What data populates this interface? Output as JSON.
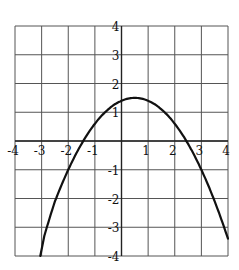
{
  "chart_data": {
    "type": "line",
    "title": "",
    "xlabel": "",
    "ylabel": "",
    "xlim": [
      -4,
      4
    ],
    "ylim": [
      -4,
      4
    ],
    "grid": true,
    "x_ticks": [
      -4,
      -3,
      -2,
      -1,
      1,
      2,
      3,
      4
    ],
    "y_ticks": [
      4,
      3,
      2,
      1,
      -1,
      -2,
      -3,
      -4
    ],
    "x_tick_labels": [
      "-4",
      "-3",
      "-2",
      "-1",
      "1",
      "2",
      "3",
      "4"
    ],
    "y_tick_labels": [
      "4",
      "3",
      "2",
      "1",
      "-1",
      "-2",
      "-3",
      "-4"
    ],
    "series": [
      {
        "name": "parabola",
        "description": "downward-opening parabola, vertex approx (0.5, 1.5), x-intercepts approx -1.44 and 2.44",
        "equation_estimate": "y = -0.4(x - 0.5)^2 + 1.5",
        "x": [
          -3.05,
          -3.0,
          -2.5,
          -2.0,
          -1.5,
          -1.0,
          -0.5,
          0.0,
          0.5,
          1.0,
          1.5,
          2.0,
          2.5,
          3.0,
          3.5,
          4.0
        ],
        "y": [
          -4.0,
          -3.4,
          -2.4,
          -1.0,
          -0.1,
          0.6,
          1.1,
          1.4,
          1.5,
          1.4,
          1.1,
          0.6,
          -0.1,
          -1.0,
          -2.1,
          -3.7
        ]
      }
    ],
    "legend": null
  }
}
